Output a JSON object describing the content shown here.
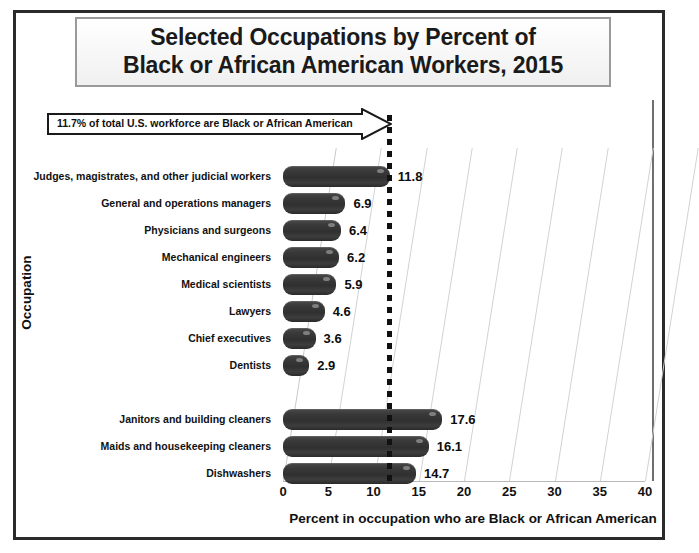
{
  "title": {
    "line1": "Selected Occupations by Percent of",
    "line2": "Black or African American Workers, 2015"
  },
  "annotation": {
    "text": "11.7% of total U.S. workforce are Black or African American",
    "value": 11.7
  },
  "axes": {
    "xlabel": "Percent in occupation who are Black or African American",
    "ylabel": "Occupation"
  },
  "chart_data": {
    "type": "bar",
    "orientation": "horizontal",
    "title": "Selected Occupations by Percent of Black or African American Workers, 2015",
    "xlabel": "Percent in occupation who are Black or African American",
    "ylabel": "Occupation",
    "xlim": [
      0,
      40
    ],
    "xticks": [
      0,
      5,
      10,
      15,
      20,
      25,
      30,
      35,
      40
    ],
    "xtick_labels": [
      "0",
      "5",
      "10",
      "15",
      "20",
      "25",
      "30",
      "35",
      "40"
    ],
    "grid": "vertical",
    "legend": "none",
    "reference_line": {
      "value": 11.7,
      "style": "dotted",
      "label": "11.7% of total U.S. workforce are Black or African American"
    },
    "categories": [
      "Judges, magistrates, and other judicial workers",
      "General and operations managers",
      "Physicians and surgeons",
      "Mechanical engineers",
      "Medical scientists",
      "Lawyers",
      "Chief executives",
      "Dentists",
      "",
      "Janitors and building cleaners",
      "Maids and housekeeping cleaners",
      "Dishwashers"
    ],
    "values": [
      11.8,
      6.9,
      6.4,
      6.2,
      5.9,
      4.6,
      3.6,
      2.9,
      null,
      17.6,
      16.1,
      14.7
    ],
    "value_labels": [
      "11.8",
      "6.9",
      "6.4",
      "6.2",
      "5.9",
      "4.6",
      "3.6",
      "2.9",
      "",
      "17.6",
      "16.1",
      "14.7"
    ],
    "bar_color": "#333333"
  }
}
